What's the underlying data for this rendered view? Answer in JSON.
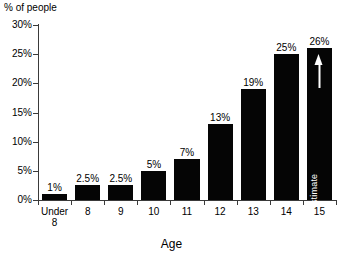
{
  "chart_data": {
    "type": "bar",
    "title": "",
    "xlabel": "Age",
    "ylabel": "% of people",
    "categories": [
      "Under 8",
      "8",
      "9",
      "10",
      "11",
      "12",
      "13",
      "14",
      "15"
    ],
    "category_lines": [
      [
        "Under",
        "8"
      ],
      [
        "8"
      ],
      [
        "9"
      ],
      [
        "10"
      ],
      [
        "11"
      ],
      [
        "12"
      ],
      [
        "13"
      ],
      [
        "14"
      ],
      [
        "15"
      ]
    ],
    "values": [
      1,
      2.5,
      2.5,
      5,
      7,
      13,
      19,
      25,
      26
    ],
    "value_labels": [
      "1%",
      "2.5%",
      "2.5%",
      "5%",
      "7%",
      "13%",
      "19%",
      "25%",
      "26%"
    ],
    "ylim": [
      0,
      30
    ],
    "ytick_values": [
      0,
      5,
      10,
      15,
      20,
      25,
      30
    ],
    "ytick_labels": [
      "0%",
      "5%",
      "10%",
      "15%",
      "20%",
      "25%",
      "30%"
    ],
    "grid": false,
    "legend": "none",
    "bar_color": "#050505",
    "axis_color": "#3a3a3a",
    "background_color": "#ffffff",
    "annotations": [
      {
        "target_category": "15",
        "text": "Estimate",
        "orientation": "vertical",
        "icon": "up-arrow",
        "color": "#ffffff"
      }
    ]
  }
}
